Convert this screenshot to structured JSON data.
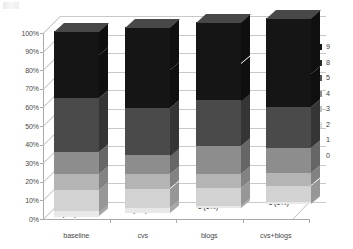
{
  "chart_data": {
    "type": "bar",
    "variant": "stacked-100-percent-3d",
    "title": "",
    "xlabel": "",
    "ylabel": "",
    "ylim": [
      0,
      100
    ],
    "ytick_labels": [
      "0%",
      "10%",
      "20%",
      "30%",
      "40%",
      "50%",
      "60%",
      "70%",
      "80%",
      "90%",
      "100%"
    ],
    "ytick_values": [
      0,
      10,
      20,
      30,
      40,
      50,
      60,
      70,
      80,
      90,
      100
    ],
    "grid": true,
    "legend_position": "right",
    "categories": [
      "baseline",
      "cvs",
      "blogs",
      "cvs+blogs"
    ],
    "legend_entries": [
      "9",
      "8",
      "5",
      "4",
      "3",
      "2",
      "1",
      "0"
    ],
    "series": [
      {
        "name": "2",
        "counts": [
          2,
          2,
          1,
          1
        ],
        "percents": [
          3,
          3,
          1,
          1
        ],
        "color": "#e8e8e8"
      },
      {
        "name": "3",
        "counts": [
          8,
          8,
          8,
          8
        ],
        "percents": [
          12,
          10,
          10,
          9
        ],
        "color": "#d2d2d2"
      },
      {
        "name": "4",
        "counts": [
          6,
          6,
          6,
          6
        ],
        "percents": [
          9,
          8,
          7,
          7
        ],
        "color": "#b4b4b4"
      },
      {
        "name": "5",
        "counts": [
          8,
          8,
          12,
          12
        ],
        "percents": [
          12,
          10,
          15,
          13
        ],
        "color": "#8d8d8d"
      },
      {
        "name": "8",
        "counts": [
          20,
          20,
          20,
          20
        ],
        "percents": [
          29,
          26,
          25,
          22
        ],
        "color": "#4a4a4a"
      },
      {
        "name": "9",
        "counts": [
          16,
          16,
          16,
          16
        ],
        "percents": [
          23,
          21,
          20,
          18
        ],
        "color": "#151515"
      },
      {
        "name": "9b",
        "counts": [
          9,
          18,
          18,
          27
        ],
        "percents": [
          13,
          23,
          22,
          30
        ],
        "color": "#151515"
      }
    ],
    "bar_labels": [
      [
        "2 (3%)",
        "8 (12%)",
        "6 (9%)",
        "8 (12%)",
        "20 (29%)",
        "16 (23%)",
        "9 (13%)"
      ],
      [
        "2 (3%)",
        "8 (10%)",
        "6 (8%)",
        "8 (10%)",
        "20 (26%)",
        "16 (21%)",
        "18 (23%)"
      ],
      [
        "1 (1%)",
        "8 (10%)",
        "6 (7%)",
        "12 (15%)",
        "20 (25%)",
        "16 (20%)",
        "18 (22%)"
      ],
      [
        "1 (1%)",
        "8 (9%)",
        "6 (7%)",
        "12 (13%)",
        "20 (22%)",
        "16 (18%)",
        "27 (30%)"
      ]
    ],
    "totals": [
      69,
      78,
      81,
      90
    ]
  },
  "legend": {
    "items": [
      {
        "label": "9",
        "color": "#151515"
      },
      {
        "label": "8",
        "color": "#2b2b2b"
      },
      {
        "label": "5",
        "color": "#555555"
      },
      {
        "label": "4",
        "color": "#8d8d8d"
      },
      {
        "label": "3",
        "color": "#c0c0c0"
      },
      {
        "label": "2",
        "color": "#dcdcdc"
      },
      {
        "label": "1",
        "color": "#f2f2f2"
      },
      {
        "label": "0",
        "color": "#fafafa"
      }
    ]
  }
}
